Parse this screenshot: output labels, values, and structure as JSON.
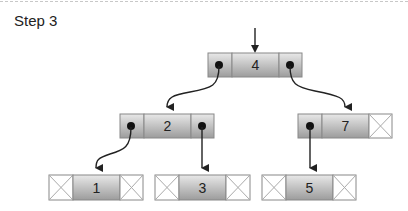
{
  "header": {
    "title": "Step 3"
  },
  "diagram": {
    "type": "binary-search-tree-linked-nodes",
    "root_pointer": true,
    "nodes": [
      {
        "value": "4",
        "left": "pointer",
        "right": "pointer"
      },
      {
        "value": "2",
        "left": "pointer",
        "right": "pointer"
      },
      {
        "value": "7",
        "left": "pointer",
        "right": "null"
      },
      {
        "value": "1",
        "left": "null",
        "right": "null"
      },
      {
        "value": "3",
        "left": "null",
        "right": "null"
      },
      {
        "value": "5",
        "left": "null",
        "right": "null"
      }
    ],
    "edges": [
      {
        "from": "4",
        "to": "2",
        "side": "left"
      },
      {
        "from": "4",
        "to": "7",
        "side": "right"
      },
      {
        "from": "2",
        "to": "1",
        "side": "left"
      },
      {
        "from": "2",
        "to": "3",
        "side": "right"
      },
      {
        "from": "7",
        "to": "5",
        "side": "left"
      }
    ],
    "colors": {
      "cell_dark": "#9a9a9a",
      "cell_light": "#e6e6e6",
      "null_cell": "#ffffff",
      "stroke": "#888888",
      "arrow": "#222222"
    }
  }
}
